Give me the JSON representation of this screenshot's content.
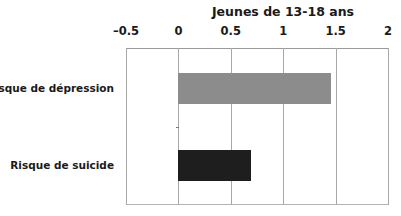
{
  "chart_data": {
    "type": "bar",
    "orientation": "horizontal",
    "title": "Jeunes de 13-18 ans",
    "categories": [
      "Risque de dépression",
      "Risque de suicide"
    ],
    "values": [
      1.46,
      0.69
    ],
    "bar_colors": [
      "#8c8c8c",
      "#1e1e1e"
    ],
    "xlabel": "",
    "ylabel": "",
    "xlim": [
      -0.5,
      2
    ],
    "xticks": [
      -0.5,
      0,
      0.5,
      1,
      1.5,
      2
    ],
    "xtick_labels": [
      "–0.5",
      "0",
      "0.5",
      "1",
      "1.5",
      "2"
    ],
    "xaxis_position": "top",
    "grid": true,
    "legend": null
  },
  "colors": {
    "gridline": "#a8a8a8",
    "text": "#1a1a1a"
  }
}
